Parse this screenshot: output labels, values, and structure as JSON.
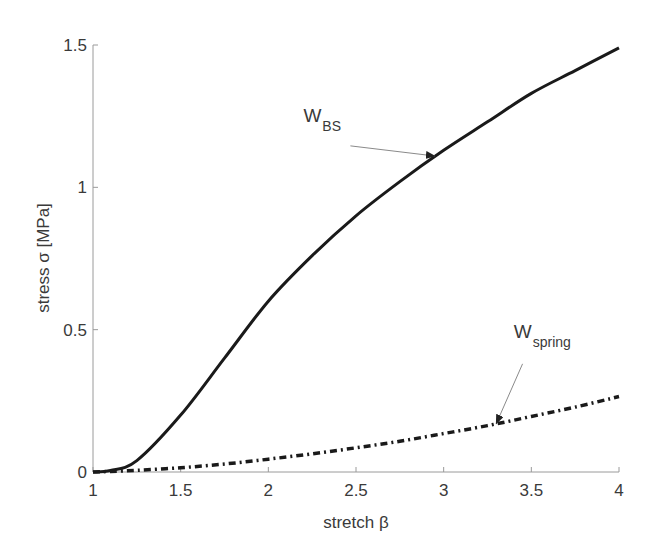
{
  "chart_data": {
    "type": "line",
    "title": "",
    "xlabel": "stretch β",
    "ylabel": "stress σ [MPa]",
    "xlim": [
      1,
      4
    ],
    "ylim": [
      0,
      1.5
    ],
    "grid": false,
    "legend": "none (inline annotations with arrows)",
    "x_ticks": [
      "1",
      "1.5",
      "2",
      "2.5",
      "3",
      "3.5",
      "4"
    ],
    "y_ticks": [
      "0",
      "0.5",
      "1",
      "1.5"
    ],
    "x": [
      1.0,
      1.1,
      1.25,
      1.5,
      1.75,
      2.0,
      2.25,
      2.5,
      2.75,
      3.0,
      3.25,
      3.5,
      3.75,
      4.0
    ],
    "series": [
      {
        "name": "W_BS",
        "style": "solid",
        "values": [
          0.0,
          0.005,
          0.04,
          0.2,
          0.4,
          0.6,
          0.76,
          0.9,
          1.02,
          1.13,
          1.23,
          1.33,
          1.41,
          1.49
        ]
      },
      {
        "name": "W_spring",
        "style": "dash-dot",
        "values": [
          0.0,
          0.002,
          0.006,
          0.015,
          0.028,
          0.045,
          0.064,
          0.085,
          0.108,
          0.135,
          0.163,
          0.195,
          0.228,
          0.265
        ]
      }
    ],
    "annotations": [
      {
        "text_main": "W",
        "text_sub": "BS",
        "label_at": [
          2.2,
          1.23
        ],
        "arrow_to": [
          2.95,
          1.11
        ]
      },
      {
        "text_main": "W",
        "text_sub": "spring",
        "label_at": [
          3.4,
          0.47
        ],
        "arrow_to": [
          3.3,
          0.17
        ]
      }
    ]
  },
  "labels": {
    "xlabel": "stretch β",
    "ylabel": "stress σ [MPa]",
    "annot_bs_main": "W",
    "annot_bs_sub": "BS",
    "annot_spring_main": "W",
    "annot_spring_sub": "spring"
  },
  "colors": {
    "curve": "#1a1a1a",
    "axis": "#9a9a9a",
    "text": "#3a3a3a",
    "arrow": "#8a8a8a"
  }
}
